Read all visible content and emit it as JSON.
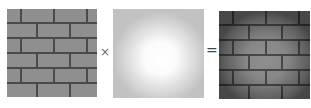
{
  "figure": {
    "panels": [
      {
        "id": "texture",
        "label": "brick texture"
      },
      {
        "id": "lightmap",
        "label": "light map"
      },
      {
        "id": "result",
        "label": "lit brick texture"
      }
    ],
    "operators": {
      "multiply": "×",
      "equals": "="
    },
    "colors": {
      "brick": "#8f8f8f",
      "mortar": "#4a4a4a",
      "light_center": "#ffffff",
      "light_edge": "#c2c2c2",
      "operator": "#6a6a6a"
    }
  }
}
